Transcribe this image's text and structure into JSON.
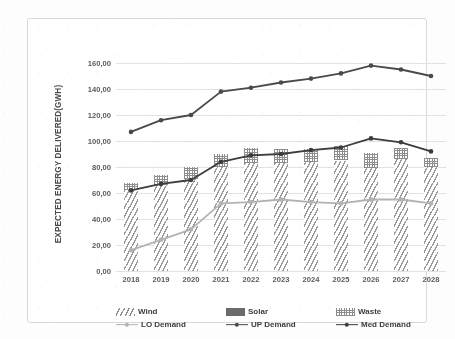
{
  "chart_data": {
    "type": "bar",
    "title": "",
    "xlabel": "",
    "ylabel": "EXPECTED ENERGY DELIVERED(GWH)",
    "categories": [
      "2018",
      "2019",
      "2020",
      "2021",
      "2022",
      "2023",
      "2024",
      "2025",
      "2026",
      "2027",
      "2028"
    ],
    "ylim": [
      0,
      160
    ],
    "ytick_labels": [
      "0,00",
      "20,00",
      "40,00",
      "60,00",
      "80,00",
      "100,00",
      "120,00",
      "140,00",
      "160,00"
    ],
    "ytick_values": [
      0,
      20,
      40,
      60,
      80,
      100,
      120,
      140,
      160
    ],
    "grid": true,
    "legend_position": "bottom",
    "stacked": true,
    "bar_series": [
      {
        "name": "Wind",
        "fill": "hatch-diagonal",
        "color": "#9a9a9a",
        "values": [
          62.0,
          66.0,
          71.0,
          80.0,
          83.0,
          83.0,
          84.0,
          85.0,
          79.0,
          86.0,
          80.0
        ]
      },
      {
        "name": "Solar",
        "fill": "solid",
        "color": "#6f6f6f",
        "values": [
          0.0,
          0.0,
          0.0,
          0.0,
          0.0,
          0.0,
          0.0,
          0.0,
          0.0,
          0.0,
          0.0
        ]
      },
      {
        "name": "Waste",
        "fill": "dotted-grid",
        "color": "#8d8d8d",
        "values": [
          6.0,
          8.0,
          9.0,
          10.0,
          12.0,
          11.0,
          10.0,
          11.0,
          12.0,
          9.0,
          7.0
        ]
      }
    ],
    "line_series": [
      {
        "name": "LO Demand",
        "color": "#b3b3b3",
        "marker": "circle",
        "values": [
          16.0,
          24.0,
          32.0,
          52.0,
          53.0,
          55.0,
          53.0,
          52.0,
          55.0,
          55.0,
          52.0
        ]
      },
      {
        "name": "UP Demand",
        "color": "#4a4a4a",
        "marker": "circle",
        "values": [
          107.0,
          116.0,
          120.0,
          138.0,
          141.0,
          145.0,
          148.0,
          152.0,
          158.0,
          155.0,
          150.0
        ]
      },
      {
        "name": "Med Demand",
        "color": "#3d3d3d",
        "marker": "circle",
        "values": [
          62.0,
          67.0,
          70.0,
          84.0,
          89.0,
          90.0,
          93.0,
          95.0,
          102.0,
          99.0,
          92.0
        ]
      }
    ]
  },
  "legend": {
    "items": [
      {
        "label": "Wind",
        "kind": "swatch",
        "style": "wind"
      },
      {
        "label": "Solar",
        "kind": "swatch",
        "style": "solar"
      },
      {
        "label": "Waste",
        "kind": "swatch",
        "style": "waste"
      },
      {
        "label": "LO Demand",
        "kind": "line",
        "color": "#b3b3b3"
      },
      {
        "label": "UP Demand",
        "kind": "line",
        "color": "#4a4a4a"
      },
      {
        "label": "Med Demand",
        "kind": "line",
        "color": "#3d3d3d"
      }
    ]
  },
  "colors": {
    "grid": "#e2e2e2",
    "frame": "#d9d9d9",
    "text": "#5b5b5b",
    "background": "#ffffff"
  }
}
